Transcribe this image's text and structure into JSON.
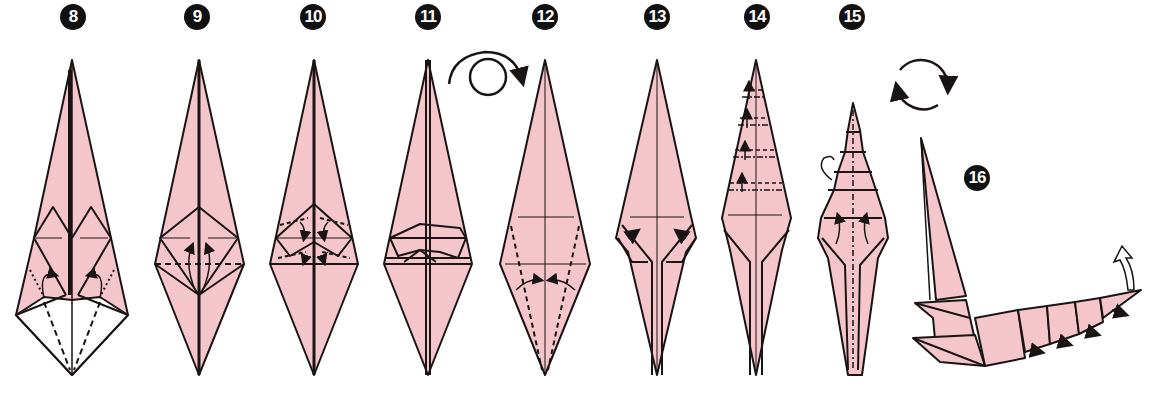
{
  "diagram": {
    "type": "origami-folding-instructions",
    "colors": {
      "paper_front": "#f4c6cb",
      "paper_back": "#ffffff",
      "line": "#1a1414",
      "badge_bg": "#111111",
      "badge_text": "#ffffff"
    },
    "steps": [
      {
        "number": "8",
        "label": "❽",
        "x": 73,
        "symbols": [
          "valley-fold-lines",
          "inside-reverse-fold-arrows"
        ]
      },
      {
        "number": "9",
        "label": "❾",
        "x": 197,
        "symbols": [
          "valley-fold-line",
          "fold-up-arrows"
        ]
      },
      {
        "number": "10",
        "label": "❿",
        "x": 313,
        "symbols": [
          "valley-fold-lines",
          "fold-down-arrows"
        ]
      },
      {
        "number": "11",
        "label": "⓫",
        "x": 428,
        "symbols": []
      },
      {
        "number": "12",
        "label": "⓬",
        "x": 545,
        "symbols": [
          "turn-over-symbol",
          "valley-fold-lines",
          "fold-in-arrows"
        ]
      },
      {
        "number": "13",
        "label": "⓭",
        "x": 657,
        "symbols": [
          "fold-arrows"
        ]
      },
      {
        "number": "14",
        "label": "⓮",
        "x": 757,
        "symbols": [
          "pleat-fold-lines",
          "fold-up-arrows"
        ]
      },
      {
        "number": "15",
        "label": "⓯",
        "x": 852,
        "symbols": [
          "mountain-fold-line",
          "fold-behind-arrow",
          "fold-up-arrows"
        ]
      },
      {
        "number": "16",
        "label": "⓰",
        "x": 972,
        "symbols": [
          "rotate-symbol",
          "lift-tail-arrow"
        ]
      }
    ],
    "annotations": {
      "turn_over": "turn-over-icon",
      "rotate": "rotate-icon"
    }
  }
}
